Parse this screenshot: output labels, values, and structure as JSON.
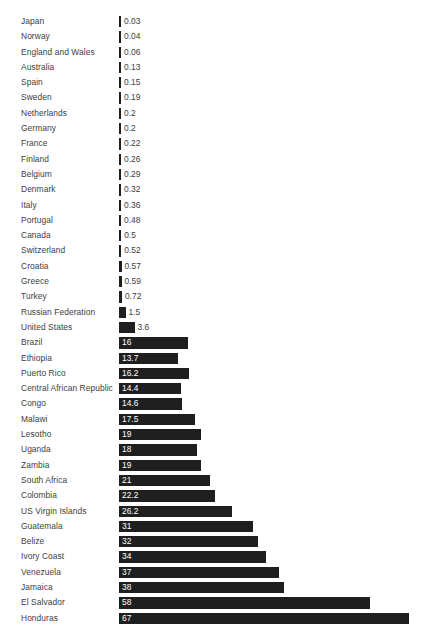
{
  "chart_data": {
    "type": "bar",
    "orientation": "horizontal",
    "title": "",
    "subtitle": "",
    "xlabel": "",
    "ylabel": "",
    "grid": false,
    "legend": null,
    "axis_visible": false,
    "tick_labels": [],
    "xlim": [
      0,
      67
    ],
    "value_label_position": "end-of-bar",
    "colors": {
      "bar": "#1f1f1f",
      "label_text": "#3c4043",
      "value_text_inside": "#ffffff",
      "value_text_outside": "#3c4043",
      "background": "#ffffff"
    },
    "categories": [
      "Japan",
      "Norway",
      "England and Wales",
      "Australia",
      "Spain",
      "Sweden",
      "Netherlands",
      "Germany",
      "France",
      "Finland",
      "Belgium",
      "Denmark",
      "Italy",
      "Portugal",
      "Canada",
      "Switzerland",
      "Croatia",
      "Greece",
      "Turkey",
      "Russian Federation",
      "United States",
      "Brazil",
      "Ethiopia",
      "Puerto Rico",
      "Central African Republic",
      "Congo",
      "Malawi",
      "Lesotho",
      "Uganda",
      "Zambia",
      "South Africa",
      "Colombia",
      "US Virgin Islands",
      "Guatemala",
      "Belize",
      "Ivory Coast",
      "Venezuela",
      "Jamaica",
      "El Salvador",
      "Honduras"
    ],
    "values": [
      0.03,
      0.04,
      0.06,
      0.13,
      0.15,
      0.19,
      0.2,
      0.2,
      0.22,
      0.26,
      0.29,
      0.32,
      0.36,
      0.48,
      0.5,
      0.52,
      0.57,
      0.59,
      0.72,
      1.5,
      3.6,
      16,
      13.7,
      16.2,
      14.4,
      14.6,
      17.5,
      19,
      18,
      19,
      21,
      22.2,
      26.2,
      31,
      32,
      34,
      37,
      38,
      58,
      67
    ],
    "value_labels": [
      "0.03",
      "0.04",
      "0.06",
      "0.13",
      "0.15",
      "0.19",
      "0.2",
      "0.2",
      "0.22",
      "0.26",
      "0.29",
      "0.32",
      "0.36",
      "0.48",
      "0.5",
      "0.52",
      "0.57",
      "0.59",
      "0.72",
      "1.5",
      "3.6",
      "16",
      "13.7",
      "16.2",
      "14.4",
      "14.6",
      "17.5",
      "19",
      "18",
      "19",
      "21",
      "22.2",
      "26.2",
      "31",
      "32",
      "34",
      "37",
      "38",
      "58",
      "67"
    ],
    "bar_pixel_lengths": [
      2,
      2,
      2,
      2,
      2,
      2,
      2,
      2,
      2,
      2,
      2,
      2,
      2,
      2.1,
      2.2,
      2.3,
      2.5,
      2.6,
      3.1,
      6.5,
      15.6,
      69.3,
      59.3,
      70.1,
      62.4,
      63.2,
      75.8,
      82.3,
      77.9,
      82.3,
      90.9,
      96.1,
      113.4,
      134.2,
      138.6,
      147.2,
      160.2,
      164.5,
      251.1,
      290.1
    ]
  }
}
